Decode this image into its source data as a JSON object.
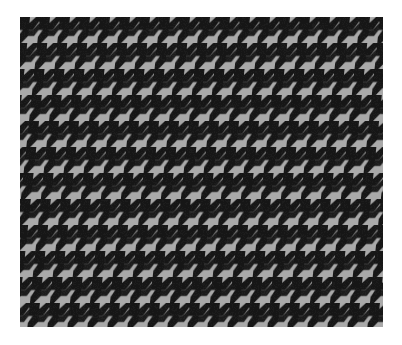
{
  "image": {
    "subject": "houndstooth fabric swatch",
    "pattern": "houndstooth",
    "colors": {
      "background": "#ffffff",
      "light_thread": "#a9a9a9",
      "dark_thread": "#141414"
    },
    "swatch_bounds": {
      "x": 20,
      "y": 17,
      "width": 363,
      "height": 310
    }
  }
}
